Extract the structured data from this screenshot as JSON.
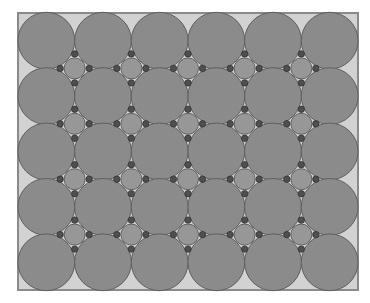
{
  "diagram": {
    "title": "",
    "grid": {
      "columns": 6,
      "rows": 5
    },
    "large_circle": {
      "count": 30,
      "fill": "#8b8b8b",
      "stroke": "#5f5f5f"
    },
    "interstitial_circle": {
      "count": 20,
      "fill": "#979797",
      "stroke": "#606060"
    },
    "contact_dot": {
      "per_interstitial": 4,
      "fill": "#4f4f4f",
      "stroke": "#333333"
    },
    "colors": {
      "page_background": "#ffffff",
      "frame_fill": "#d2d2d2",
      "frame_stroke": "#8a8a8a"
    }
  }
}
